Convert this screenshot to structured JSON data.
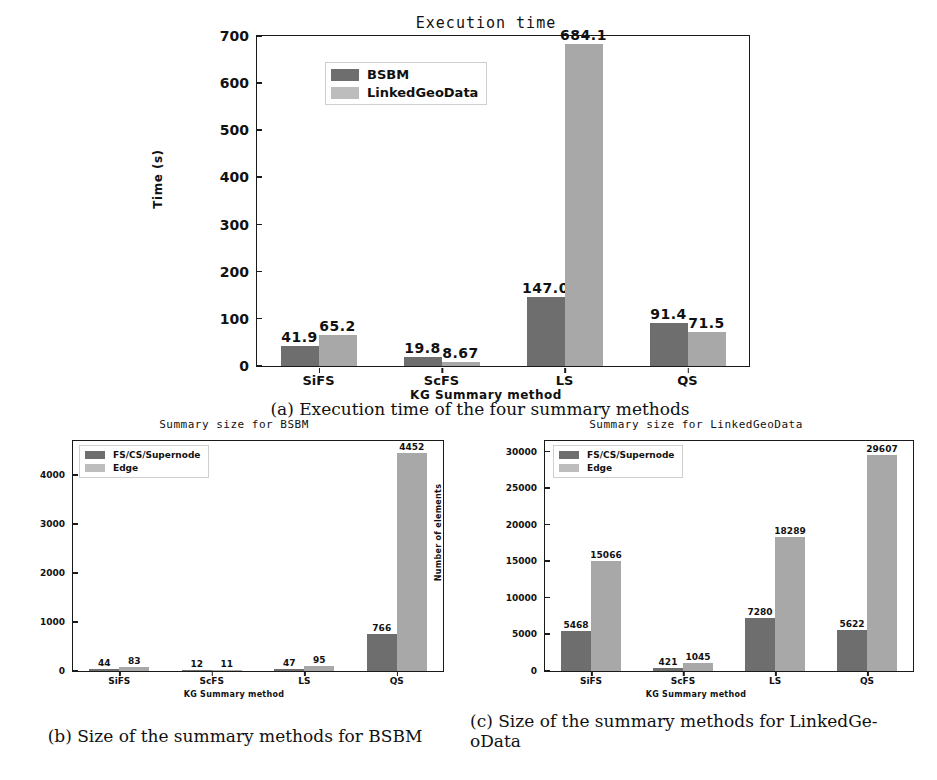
{
  "figure": {
    "captions": {
      "a": "(a) Execution time of the four summary methods",
      "b": "(b) Size of the summary methods for BSBM",
      "c_line1": "(c) Size of the summary methods for LinkedGe-",
      "c_line2": "oData"
    }
  },
  "colors": {
    "series_dark": "#6e6e6e",
    "series_light": "#a8a8a8",
    "axis": "#1a1a1a",
    "background": "#ffffff"
  },
  "chart_data": [
    {
      "id": "a",
      "type": "bar",
      "title": "Execution time",
      "xlabel": "KG Summary method",
      "ylabel": "Time (s)",
      "categories": [
        "SiFS",
        "ScFS",
        "LS",
        "QS"
      ],
      "ylim": [
        0,
        700
      ],
      "yticks": [
        0,
        100,
        200,
        300,
        400,
        500,
        600,
        700
      ],
      "ytick_labels": [
        "0",
        "100",
        "200",
        "300",
        "400",
        "500",
        "600",
        "700"
      ],
      "grid": false,
      "legend_position": "upper-left",
      "series": [
        {
          "name": "BSBM",
          "values": [
            41.9,
            19.8,
            147.0,
            91.4
          ],
          "labels": [
            "41.9",
            "19.8",
            "147.0",
            "91.4"
          ]
        },
        {
          "name": "LinkedGeoData",
          "values": [
            65.2,
            8.67,
            684.1,
            71.5
          ],
          "labels": [
            "65.2",
            "8.67",
            "684.1",
            "71.5"
          ]
        }
      ]
    },
    {
      "id": "b",
      "type": "bar",
      "title": "Summary size for BSBM",
      "xlabel": "KG Summary method",
      "ylabel": "Number of elements",
      "categories": [
        "SiFS",
        "ScFS",
        "LS",
        "QS"
      ],
      "ylim": [
        0,
        4700
      ],
      "yticks": [
        0,
        1000,
        2000,
        3000,
        4000
      ],
      "ytick_labels": [
        "0",
        "1000",
        "2000",
        "3000",
        "4000"
      ],
      "grid": false,
      "legend_position": "upper-left",
      "series": [
        {
          "name": "FS/CS/Supernode",
          "values": [
            44,
            12,
            47,
            766
          ],
          "labels": [
            "44",
            "12",
            "47",
            "766"
          ]
        },
        {
          "name": "Edge",
          "values": [
            83,
            11,
            95,
            4452
          ],
          "labels": [
            "83",
            "11",
            "95",
            "4452"
          ]
        }
      ]
    },
    {
      "id": "c",
      "type": "bar",
      "title": "Summary size for LinkedGeoData",
      "xlabel": "KG Summary method",
      "ylabel": "Number of elements",
      "categories": [
        "SiFS",
        "ScFS",
        "LS",
        "QS"
      ],
      "ylim": [
        0,
        31500
      ],
      "yticks": [
        0,
        5000,
        10000,
        15000,
        20000,
        25000,
        30000
      ],
      "ytick_labels": [
        "0",
        "5000",
        "10000",
        "15000",
        "20000",
        "25000",
        "30000"
      ],
      "grid": false,
      "legend_position": "upper-left",
      "series": [
        {
          "name": "FS/CS/Supernode",
          "values": [
            5468,
            421,
            7280,
            5622
          ],
          "labels": [
            "5468",
            "421",
            "7280",
            "5622"
          ]
        },
        {
          "name": "Edge",
          "values": [
            15066,
            1045,
            18289,
            29607
          ],
          "labels": [
            "15066",
            "1045",
            "18289",
            "29607"
          ]
        }
      ]
    }
  ]
}
